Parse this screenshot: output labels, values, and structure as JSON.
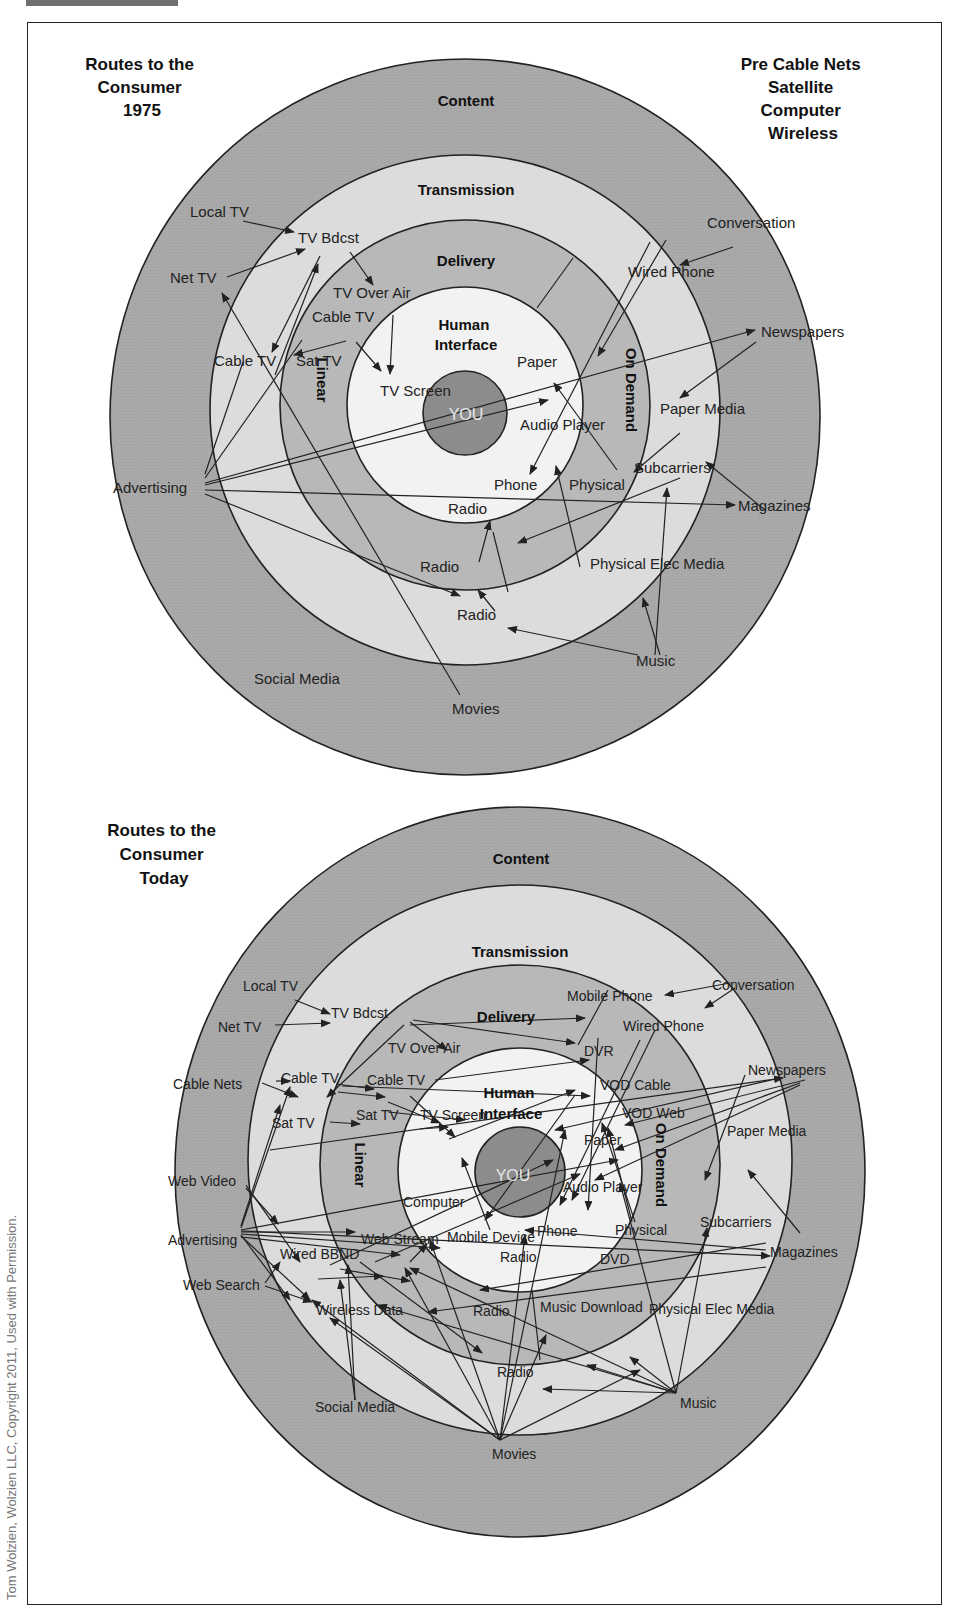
{
  "figure": {
    "credit": "Tom Wolzien, Wolzien LLC, Copyright 2011, Used with Permission.",
    "colors": {
      "content_ring": "#a9a9a9",
      "transmission_ring": "#dcdcdc",
      "delivery_ring": "#b8b8b8",
      "human_interface": "#f2f2f2",
      "you_core": "#8c8c8c",
      "line": "#222222"
    }
  },
  "top": {
    "title": [
      "Routes to the",
      "Consumer",
      "1975"
    ],
    "side_note": [
      "Pre Cable Nets",
      "Satellite",
      "Computer",
      "Wireless"
    ],
    "rings": {
      "content": "Content",
      "transmission": "Transmission",
      "delivery": "Delivery",
      "human_interface": [
        "Human",
        "Interface"
      ],
      "linear": "Linear",
      "on_demand": "On Demand",
      "core": "YOU"
    },
    "content_nodes": [
      "Local TV",
      "Net TV",
      "Advertising",
      "Social Media",
      "Movies",
      "Music",
      "Magazines",
      "Newspapers",
      "Conversation"
    ],
    "transmission_nodes": [
      "TV Bdcst",
      "Cable TV",
      "Radio",
      "Physical Elec Media",
      "Subcarriers",
      "Paper Media",
      "Wired Phone"
    ],
    "delivery_nodes": [
      "TV Over Air",
      "Cable TV",
      "Sat TV",
      "Radio",
      "Physical"
    ],
    "interface_nodes": [
      "TV Screen",
      "Paper",
      "Audio Player",
      "Phone",
      "Radio"
    ]
  },
  "bottom": {
    "title": [
      "Routes to the",
      "Consumer",
      "Today"
    ],
    "rings": {
      "content": "Content",
      "transmission": "Transmission",
      "delivery": "Delivery",
      "human_interface": [
        "Human",
        "Interface"
      ],
      "linear": "Linear",
      "on_demand": "On Demand",
      "core": "YOU"
    },
    "content_nodes": [
      "Local TV",
      "Net TV",
      "Cable Nets",
      "Web Video",
      "Advertising",
      "Web Search",
      "Social Media",
      "Movies",
      "Music",
      "Magazines",
      "Newspapers",
      "Conversation"
    ],
    "transmission_nodes": [
      "TV Bdcst",
      "Cable TV",
      "Sat TV",
      "Wired BBND",
      "Wireless Data",
      "Radio",
      "Physical Elec Media",
      "Subcarriers",
      "Paper Media",
      "Wired Phone",
      "Mobile Phone"
    ],
    "delivery_nodes": [
      "TV Over Air",
      "Cable TV",
      "Sat TV",
      "Web Stream",
      "Radio",
      "Music Download",
      "DVD",
      "Physical",
      "VOD Web",
      "VOD Cable",
      "DVR"
    ],
    "interface_nodes": [
      "TV Screen",
      "Computer",
      "Mobile Device",
      "Radio",
      "Phone",
      "Audio Player",
      "Paper"
    ]
  }
}
